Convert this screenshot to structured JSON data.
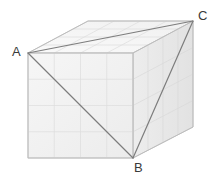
{
  "figure": {
    "type": "geometry-diagram",
    "background_color": "#ffffff"
  },
  "labels": [
    {
      "id": "A",
      "text": "A",
      "vertex": "front-top-left"
    },
    {
      "id": "B",
      "text": "B",
      "vertex": "front-bottom-right"
    },
    {
      "id": "C",
      "text": "C",
      "vertex": "back-top-right"
    }
  ],
  "solid": {
    "grid_divisions": 4,
    "faces": {
      "front": {
        "name": "front-face",
        "fill": "#f2f2f2",
        "points": "28,53 133,53 133,158 28,158"
      },
      "top": {
        "name": "top-face",
        "fill": "#f7f7f7",
        "points": "28,53 88,21 193,21 133,53"
      },
      "right": {
        "name": "right-face",
        "fill": "#e8e8e8",
        "points": "133,53 193,21 193,127 133,158"
      }
    },
    "edge_color": "#c9c9c9",
    "grid_line_color": "#dedede",
    "outline_color": "#bdbdbd"
  },
  "triangle": {
    "name": "triangle-ABC",
    "stroke": "#7d7d7d",
    "stroke_width": 1.2,
    "vertices": {
      "A": {
        "x": 28,
        "y": 53
      },
      "B": {
        "x": 133,
        "y": 158
      },
      "C": {
        "x": 193,
        "y": 21
      }
    },
    "edges": [
      {
        "id": "AC",
        "from": "A",
        "to": "C"
      },
      {
        "id": "AB",
        "from": "A",
        "to": "B"
      },
      {
        "id": "BC",
        "from": "B",
        "to": "C"
      }
    ]
  },
  "colors": {
    "front_fill": "#f2f2f2",
    "top_fill": "#f7f7f7",
    "right_fill": "#e8e8e8",
    "grid": "#dedede",
    "triangle": "#7d7d7d",
    "label": "#3a3a3a"
  }
}
